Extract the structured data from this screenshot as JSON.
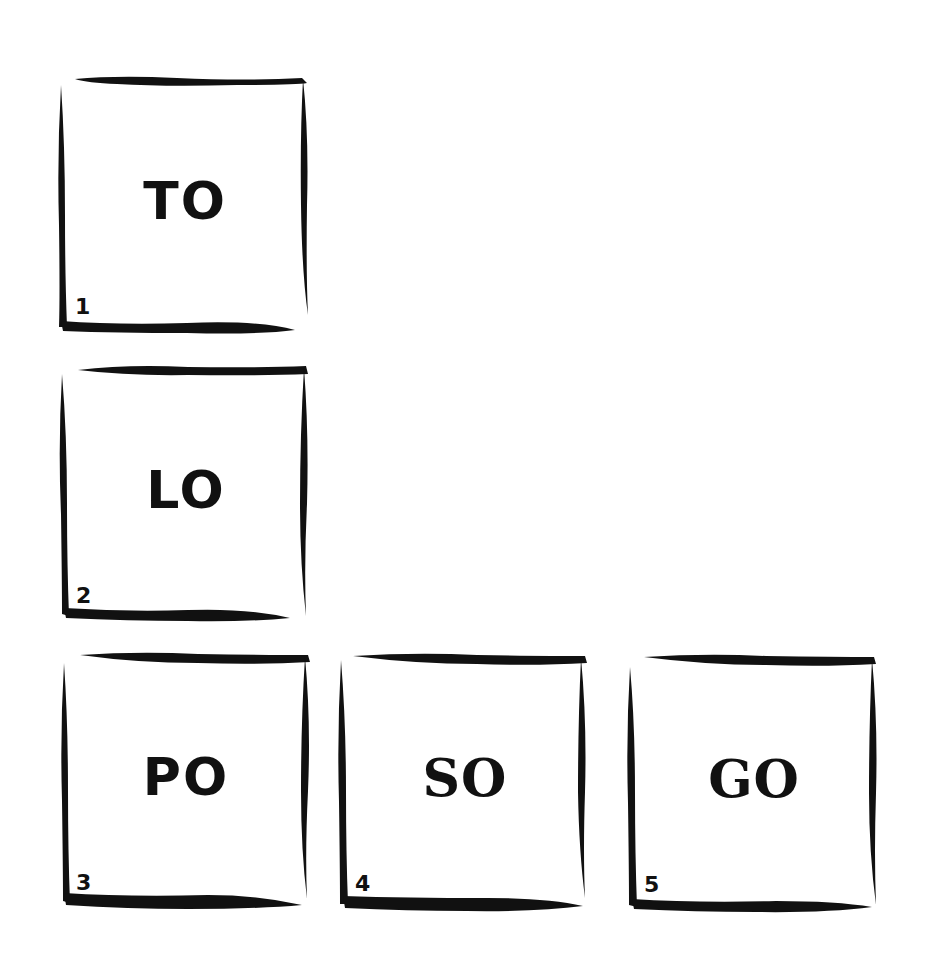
{
  "colors": {
    "ink": "#111111",
    "background": "#ffffff"
  },
  "boxes": [
    {
      "number": "1",
      "syllable": "TO",
      "x": 57,
      "y": 75
    },
    {
      "number": "2",
      "syllable": "LO",
      "x": 58,
      "y": 364
    },
    {
      "number": "3",
      "syllable": "PO",
      "x": 58,
      "y": 651
    },
    {
      "number": "4",
      "syllable": "SO",
      "x": 337,
      "y": 652
    },
    {
      "number": "5",
      "syllable": "GO",
      "x": 626,
      "y": 653
    }
  ]
}
